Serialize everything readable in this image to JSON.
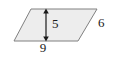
{
  "figure": {
    "kind": "geometry-diagram",
    "shape_name": "parallelogram",
    "background_color": "#ffffff",
    "fill_color": "#ededed",
    "stroke_color": "#808080",
    "label_color": "#1a1a1a",
    "vertices": {
      "bottom_left": [
        14,
        41
      ],
      "top_left": [
        31,
        9
      ],
      "top_right": [
        97,
        9
      ],
      "bottom_right": [
        78,
        41
      ]
    },
    "height_arrow": {
      "name": "height-dimension-arrow",
      "x": 46,
      "y_top": 9,
      "y_bottom": 41,
      "double_headed": true
    },
    "labels": {
      "height": {
        "text": "5",
        "x": 52,
        "y": 25,
        "anchor": "start",
        "meaning": "height of parallelogram"
      },
      "base": {
        "text": "9",
        "x": 43,
        "y": 49,
        "anchor": "middle",
        "meaning": "length of base (bottom side)"
      },
      "side": {
        "text": "6",
        "x": 98,
        "y": 24,
        "anchor": "start",
        "meaning": "length of slanted side"
      }
    }
  }
}
